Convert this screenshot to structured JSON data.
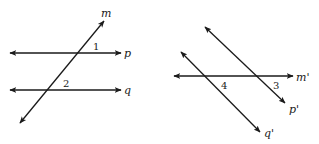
{
  "figures": [
    {
      "name": "figure-left",
      "lines": [
        {
          "id": "p",
          "label": "p",
          "x1": 10,
          "y1": 53,
          "x2": 121,
          "y2": 53,
          "lx": 124,
          "ly": 57
        },
        {
          "id": "q",
          "label": "q",
          "x1": 10,
          "y1": 90,
          "x2": 121,
          "y2": 90,
          "lx": 124,
          "ly": 94
        },
        {
          "id": "m",
          "label": "m",
          "x1": 20,
          "y1": 123,
          "x2": 104,
          "y2": 21,
          "lx": 101,
          "ly": 17
        }
      ],
      "angles": [
        {
          "label": "1",
          "x": 93,
          "y": 50
        },
        {
          "label": "2",
          "x": 63,
          "y": 87
        }
      ]
    },
    {
      "name": "figure-right",
      "lines": [
        {
          "id": "m'",
          "label": "m'",
          "x1": 174,
          "y1": 76,
          "x2": 293,
          "y2": 76,
          "lx": 296,
          "ly": 81
        },
        {
          "id": "p'",
          "label": "p'",
          "x1": 205,
          "y1": 27,
          "x2": 285,
          "y2": 103,
          "lx": 289,
          "ly": 113
        },
        {
          "id": "q'",
          "label": "q'",
          "x1": 181,
          "y1": 52,
          "x2": 260,
          "y2": 132,
          "lx": 264,
          "ly": 137
        }
      ],
      "angles": [
        {
          "label": "3",
          "x": 273,
          "y": 89
        },
        {
          "label": "4",
          "x": 221,
          "y": 89
        }
      ]
    }
  ],
  "colors": {
    "stroke": "#1a1a1a",
    "background": "#ffffff"
  }
}
